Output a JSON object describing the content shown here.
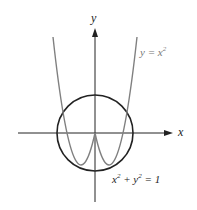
{
  "diagram": {
    "axes": {
      "x_label": "x",
      "y_label": "y"
    },
    "curves": [
      {
        "name": "parabola",
        "equation_base": "y = x",
        "exponent": "2",
        "color": "#808080"
      },
      {
        "name": "circle",
        "equation_x": "x",
        "equation_y": " + y",
        "equation_rest": " = 1",
        "exponent": "2",
        "color": "#222222"
      }
    ]
  }
}
